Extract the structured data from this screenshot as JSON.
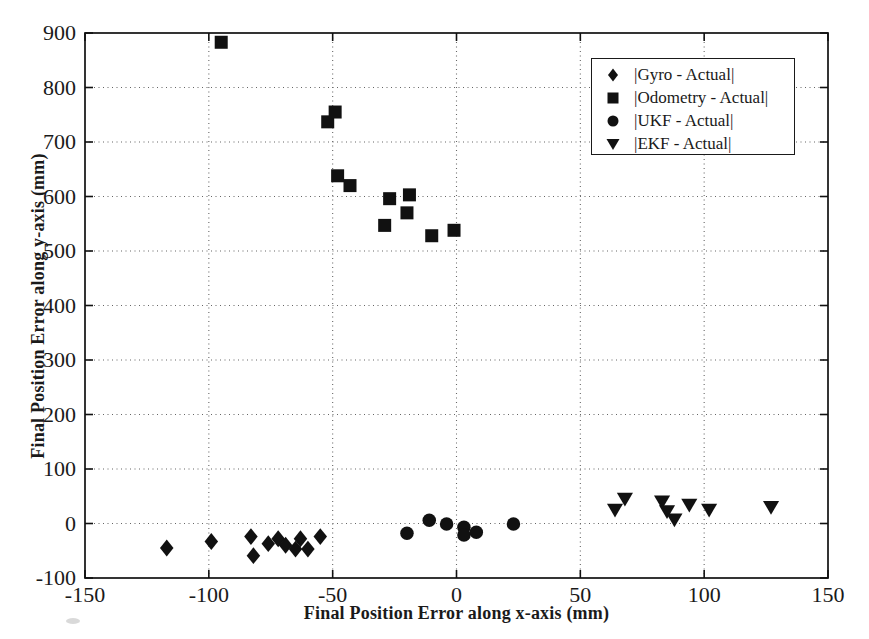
{
  "figure": {
    "background": "#ffffff",
    "ink_color": "#111111",
    "grid_color": "#666666"
  },
  "chart_data": {
    "type": "scatter",
    "title": "",
    "xlabel": "Final Position Error along x-axis (mm)",
    "ylabel": "Final Position Error along y-axis (mm)",
    "xlim": [
      -150,
      150
    ],
    "ylim": [
      -100,
      900
    ],
    "x_ticks": [
      -150,
      -100,
      -50,
      0,
      50,
      100,
      150
    ],
    "y_ticks": [
      -100,
      0,
      100,
      200,
      300,
      400,
      500,
      600,
      700,
      800,
      900
    ],
    "grid": "dotted",
    "legend_position": "upper-right",
    "series": [
      {
        "name": "|Gyro - Actual|",
        "marker": "diamond",
        "points": [
          [
            -117,
            -45
          ],
          [
            -99,
            -33
          ],
          [
            -83,
            -24
          ],
          [
            -82,
            -59
          ],
          [
            -76,
            -37
          ],
          [
            -72,
            -28
          ],
          [
            -69,
            -40
          ],
          [
            -65,
            -47
          ],
          [
            -63,
            -28
          ],
          [
            -60,
            -47
          ],
          [
            -55,
            -24
          ]
        ]
      },
      {
        "name": "|Odometry - Actual|",
        "marker": "square",
        "points": [
          [
            -95,
            883
          ],
          [
            -52,
            737
          ],
          [
            -49,
            755
          ],
          [
            -48,
            638
          ],
          [
            -43,
            620
          ],
          [
            -29,
            547
          ],
          [
            -27,
            596
          ],
          [
            -20,
            570
          ],
          [
            -19,
            603
          ],
          [
            -10,
            528
          ],
          [
            -1,
            538
          ]
        ]
      },
      {
        "name": "|UKF - Actual|",
        "marker": "circle",
        "points": [
          [
            -20,
            -18
          ],
          [
            -11,
            6
          ],
          [
            -4,
            -1
          ],
          [
            3,
            -7
          ],
          [
            3,
            -21
          ],
          [
            8,
            -16
          ],
          [
            23,
            -1
          ]
        ]
      },
      {
        "name": "|EKF - Actual|",
        "marker": "triangle-down",
        "points": [
          [
            64,
            25
          ],
          [
            68,
            45
          ],
          [
            83,
            40
          ],
          [
            85,
            22
          ],
          [
            88,
            7
          ],
          [
            94,
            34
          ],
          [
            102,
            25
          ],
          [
            127,
            30
          ]
        ]
      }
    ]
  }
}
